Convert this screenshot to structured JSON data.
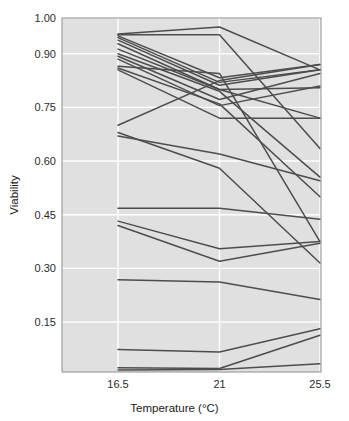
{
  "chart_data": {
    "type": "line",
    "title": "",
    "subtitle": "",
    "xlabel": "Temperature (°C)",
    "ylabel": "Viability",
    "x": [
      16.5,
      21,
      25.5
    ],
    "x_tick_labels": [
      "16.5",
      "21",
      "25.5"
    ],
    "y_ticks": [
      0.15,
      0.3,
      0.45,
      0.6,
      0.75,
      0.9,
      1.0
    ],
    "y_tick_labels": [
      "0.15",
      "0.30",
      "0.45",
      "0.60",
      "0.75",
      "0.90",
      "1.00"
    ],
    "ylim": [
      0.0,
      1.0
    ],
    "xlim": [
      16.5,
      25.5
    ],
    "grid": true,
    "grid_color": "#ffffff",
    "panel_background": "#e0e0e0",
    "line_color": "#4d4d4d",
    "legend": "none",
    "legend_position": "none",
    "annotations": [],
    "series": [
      {
        "name": "line-01",
        "values": [
          0.955,
          0.975,
          0.855
        ]
      },
      {
        "name": "line-02",
        "values": [
          0.953,
          0.953,
          0.635
        ]
      },
      {
        "name": "line-03",
        "values": [
          0.95,
          0.833,
          0.87
        ]
      },
      {
        "name": "line-04",
        "values": [
          0.945,
          0.82,
          0.855
        ]
      },
      {
        "name": "line-05",
        "values": [
          0.938,
          0.812,
          0.855
        ]
      },
      {
        "name": "line-06",
        "values": [
          0.928,
          0.8,
          0.805
        ]
      },
      {
        "name": "line-07",
        "values": [
          0.913,
          0.8,
          0.72
        ]
      },
      {
        "name": "line-08",
        "values": [
          0.9,
          0.795,
          0.555
        ]
      },
      {
        "name": "line-09",
        "values": [
          0.893,
          0.772,
          0.845
        ]
      },
      {
        "name": "line-10",
        "values": [
          0.885,
          0.755,
          0.81
        ]
      },
      {
        "name": "line-11",
        "values": [
          0.865,
          0.845,
          0.375
        ]
      },
      {
        "name": "line-12",
        "values": [
          0.86,
          0.76,
          0.5
        ]
      },
      {
        "name": "line-13",
        "values": [
          0.855,
          0.72,
          0.72
        ]
      },
      {
        "name": "line-14",
        "values": [
          0.7,
          0.825,
          0.87
        ]
      },
      {
        "name": "line-15",
        "values": [
          0.68,
          0.58,
          0.315
        ]
      },
      {
        "name": "line-16",
        "values": [
          0.67,
          0.62,
          0.545
        ]
      },
      {
        "name": "line-17",
        "values": [
          0.468,
          0.468,
          0.437
        ]
      },
      {
        "name": "line-18",
        "values": [
          0.432,
          0.355,
          0.375
        ]
      },
      {
        "name": "line-19",
        "values": [
          0.42,
          0.32,
          0.37
        ]
      },
      {
        "name": "line-20",
        "values": [
          0.268,
          0.262,
          0.213
        ]
      },
      {
        "name": "line-21",
        "values": [
          0.073,
          0.066,
          0.131
        ]
      },
      {
        "name": "line-22",
        "values": [
          0.022,
          0.02,
          0.113
        ]
      },
      {
        "name": "line-23",
        "values": [
          0.016,
          0.017,
          0.033
        ]
      }
    ]
  },
  "axes": {
    "y_title": "Viability",
    "x_title": "Temperature (°C)"
  }
}
